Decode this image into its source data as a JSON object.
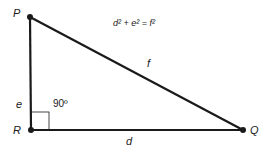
{
  "diagram": {
    "type": "right-triangle",
    "equation": "d² + e² = f²",
    "vertices": [
      {
        "id": "P",
        "label": "P",
        "x": 30,
        "y": 17
      },
      {
        "id": "R",
        "label": "R",
        "x": 31,
        "y": 130
      },
      {
        "id": "Q",
        "label": "Q",
        "x": 243,
        "y": 130
      }
    ],
    "sides": [
      {
        "id": "e",
        "label": "e",
        "from": "P",
        "to": "R"
      },
      {
        "id": "d",
        "label": "d",
        "from": "R",
        "to": "Q"
      },
      {
        "id": "f",
        "label": "f",
        "from": "P",
        "to": "Q"
      }
    ],
    "right_angle": {
      "vertex": "R",
      "label": "90º"
    },
    "colors": {
      "line": "#1a1a1a",
      "background": "#ffffff"
    }
  }
}
